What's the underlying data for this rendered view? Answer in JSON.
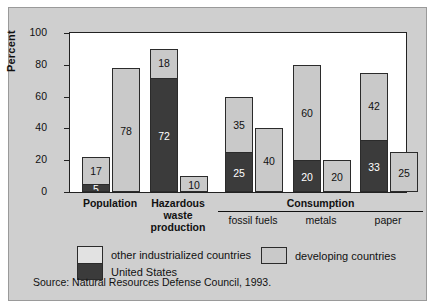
{
  "chart_data": {
    "type": "bar",
    "subtype": "grouped-stacked",
    "title": "",
    "xlabel": "",
    "ylabel": "Percent",
    "ylim": [
      0,
      100
    ],
    "yticks": [
      0,
      20,
      40,
      60,
      80,
      100
    ],
    "grid": false,
    "legend_position": "bottom",
    "series": [
      {
        "name": "United States",
        "color": "#3b3b3b",
        "values": [
          5,
          72,
          25,
          20,
          33
        ]
      },
      {
        "name": "other industrialized countries",
        "color": "#c9c9c9",
        "values": [
          17,
          18,
          35,
          60,
          42
        ]
      },
      {
        "name": "developing countries",
        "color": "#c9c9c9",
        "values": [
          78,
          10,
          40,
          20,
          25
        ]
      }
    ],
    "categories": [
      "Population",
      "Hazardous waste production",
      "fossil fuels",
      "metals",
      "paper"
    ],
    "groups": [
      {
        "label": "Population",
        "label_lines": [
          "Population"
        ],
        "bold": true,
        "bars": [
          {
            "name": "industrialized-stack",
            "segments": [
              {
                "series": "other industrialized countries",
                "value": 17,
                "label": "17",
                "fill": "light"
              },
              {
                "series": "United States",
                "value": 5,
                "label": "5",
                "fill": "dark"
              }
            ],
            "total": 22
          },
          {
            "name": "developing",
            "segments": [
              {
                "series": "developing countries",
                "value": 78,
                "label": "78",
                "fill": "dev"
              }
            ],
            "total": 78
          }
        ]
      },
      {
        "label": "Hazardous waste production",
        "label_lines": [
          "Hazardous",
          "waste",
          "production"
        ],
        "bold": true,
        "bars": [
          {
            "name": "industrialized-stack",
            "segments": [
              {
                "series": "other industrialized countries",
                "value": 18,
                "label": "18",
                "fill": "light"
              },
              {
                "series": "United States",
                "value": 72,
                "label": "72",
                "fill": "dark"
              }
            ],
            "total": 90
          },
          {
            "name": "developing",
            "segments": [
              {
                "series": "developing countries",
                "value": 10,
                "label": "10",
                "fill": "dev"
              }
            ],
            "total": 10
          }
        ]
      },
      {
        "label": "fossil fuels",
        "label_lines": [
          "fossil fuels"
        ],
        "bold": false,
        "bars": [
          {
            "name": "industrialized-stack",
            "segments": [
              {
                "series": "other industrialized countries",
                "value": 35,
                "label": "35",
                "fill": "light"
              },
              {
                "series": "United States",
                "value": 25,
                "label": "25",
                "fill": "dark"
              }
            ],
            "total": 60
          },
          {
            "name": "developing",
            "segments": [
              {
                "series": "developing countries",
                "value": 40,
                "label": "40",
                "fill": "dev"
              }
            ],
            "total": 40
          }
        ]
      },
      {
        "label": "metals",
        "label_lines": [
          "metals"
        ],
        "bold": false,
        "bars": [
          {
            "name": "industrialized-stack",
            "segments": [
              {
                "series": "other industrialized countries",
                "value": 60,
                "label": "60",
                "fill": "light"
              },
              {
                "series": "United States",
                "value": 20,
                "label": "20",
                "fill": "dark"
              }
            ],
            "total": 80
          },
          {
            "name": "developing",
            "segments": [
              {
                "series": "developing countries",
                "value": 20,
                "label": "20",
                "fill": "dev"
              }
            ],
            "total": 20
          }
        ]
      },
      {
        "label": "paper",
        "label_lines": [
          "paper"
        ],
        "bold": false,
        "bars": [
          {
            "name": "industrialized-stack",
            "segments": [
              {
                "series": "other industrialized countries",
                "value": 42,
                "label": "42",
                "fill": "light"
              },
              {
                "series": "United States",
                "value": 33,
                "label": "33",
                "fill": "dark"
              }
            ],
            "total": 75
          },
          {
            "name": "developing",
            "segments": [
              {
                "series": "developing countries",
                "value": 25,
                "label": "25",
                "fill": "dev"
              }
            ],
            "total": 25
          }
        ]
      }
    ],
    "group_heading": "Consumption",
    "annotations": []
  },
  "axis": {
    "y_title": "Percent",
    "y_tick_labels": [
      "0",
      "20",
      "40",
      "60",
      "80",
      "100"
    ]
  },
  "labels": {
    "population": "Population",
    "hazardous_1": "Hazardous",
    "hazardous_2": "waste",
    "hazardous_3": "production",
    "consumption": "Consumption",
    "fossil_fuels": "fossil fuels",
    "metals": "metals",
    "paper": "paper"
  },
  "legend": {
    "items": [
      {
        "label": "other industrialized countries",
        "swatch": "stacked-light-top",
        "color": "#e2e2e2"
      },
      {
        "label": "United States",
        "swatch": "stacked-dark-bottom",
        "color": "#3b3b3b"
      },
      {
        "label": "developing countries",
        "swatch": "solid-gray",
        "color": "#c9c9c9"
      }
    ]
  },
  "source": {
    "note": "Source: Natural Resources Defense Council, 1993."
  },
  "colors": {
    "panel_background": "#cfcfcf",
    "plot_background": "#ffffff",
    "dark_fill": "#3b3b3b",
    "light_fill": "#c9c9c9",
    "axis": "#222222"
  }
}
